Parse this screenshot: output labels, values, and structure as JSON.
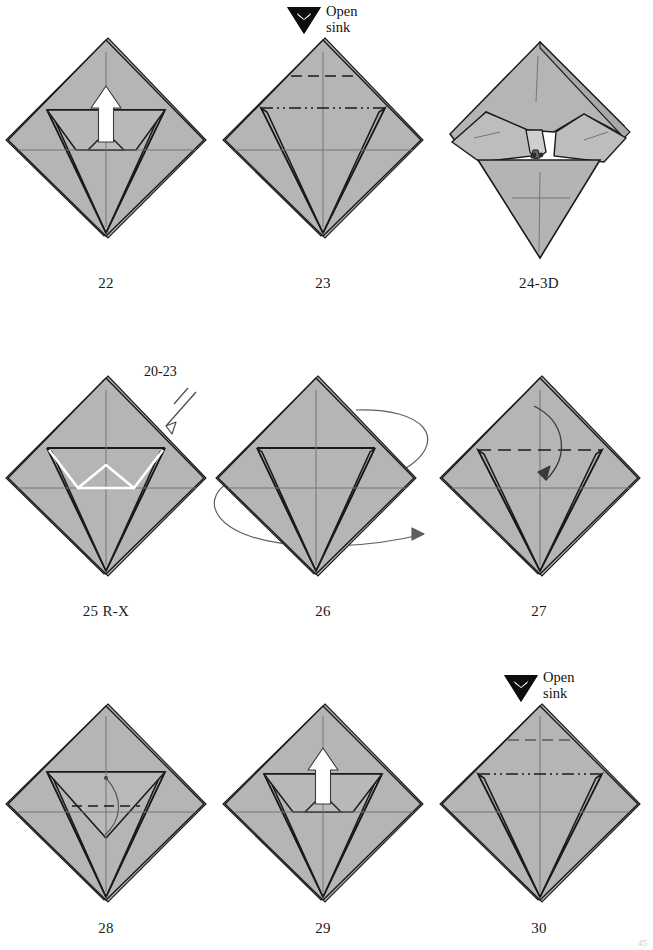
{
  "page": {
    "width": 653,
    "height": 950,
    "background": "#ffffff",
    "page_number": "45"
  },
  "palette": {
    "paper_fill": "#b3b3b3",
    "paper_fill_light": "#c4c4c4",
    "paper_fill_dark": "#a6a6a6",
    "outline": "#1a1a1a",
    "crease_line": "#6e6e6e",
    "valley_dash": "#1a1a1a",
    "sink_line": "#1a1a1a",
    "action_arrow": "#ffffff",
    "arrow_outline": "#2a2a2a",
    "rotate_arrow": "#55585c",
    "text": "#111111"
  },
  "figures": [
    {
      "id": "fig-22",
      "caption": "22",
      "row": 1,
      "col": 1,
      "shape": "square-base-diamond",
      "annotations": [
        {
          "type": "push-arrow-white",
          "direction": "up",
          "label": ""
        }
      ]
    },
    {
      "id": "fig-23",
      "caption": "23",
      "row": 1,
      "col": 2,
      "shape": "square-base-diamond",
      "annotations": [
        {
          "type": "open-sink-marker",
          "label_line1": "Open",
          "label_line2": "sink"
        },
        {
          "type": "valley-dash-line",
          "position": "upper"
        },
        {
          "type": "dash-dot-dot-line",
          "position": "mid-upper"
        }
      ]
    },
    {
      "id": "fig-24",
      "caption": "24-3D",
      "row": 1,
      "col": 3,
      "shape": "three-dimensional-open-sink",
      "annotations": []
    },
    {
      "id": "fig-25",
      "caption": "25 R-X",
      "row": 2,
      "col": 1,
      "shape": "square-base-diamond",
      "annotations": [
        {
          "type": "repeat-arrow",
          "label": "20-23"
        },
        {
          "type": "white-highlight-fold",
          "label": ""
        }
      ]
    },
    {
      "id": "fig-26",
      "caption": "26",
      "row": 2,
      "col": 2,
      "shape": "square-base-diamond",
      "annotations": [
        {
          "type": "turn-over-loop-arrow",
          "label": ""
        }
      ]
    },
    {
      "id": "fig-27",
      "caption": "27",
      "row": 2,
      "col": 3,
      "shape": "square-base-diamond",
      "annotations": [
        {
          "type": "valley-dash-line",
          "position": "upper"
        },
        {
          "type": "fold-down-arrow",
          "direction": "down"
        }
      ]
    },
    {
      "id": "fig-28",
      "caption": "28",
      "row": 3,
      "col": 1,
      "shape": "square-base-diamond",
      "annotations": [
        {
          "type": "valley-dash-line",
          "position": "inner"
        },
        {
          "type": "fold-curve-arrow",
          "direction": "down"
        }
      ]
    },
    {
      "id": "fig-29",
      "caption": "29",
      "row": 3,
      "col": 2,
      "shape": "square-base-diamond",
      "annotations": [
        {
          "type": "push-arrow-white",
          "direction": "up",
          "label": ""
        }
      ]
    },
    {
      "id": "fig-30",
      "caption": "30",
      "row": 3,
      "col": 3,
      "shape": "square-base-diamond",
      "annotations": [
        {
          "type": "open-sink-marker",
          "label_line1": "Open",
          "label_line2": "sink"
        },
        {
          "type": "valley-dash-line",
          "position": "upper"
        },
        {
          "type": "dash-dot-dot-line",
          "position": "mid-upper"
        }
      ]
    }
  ],
  "labels": {
    "open_sink_line1": "Open",
    "open_sink_line2": "sink",
    "repeat_steps": "20-23"
  }
}
